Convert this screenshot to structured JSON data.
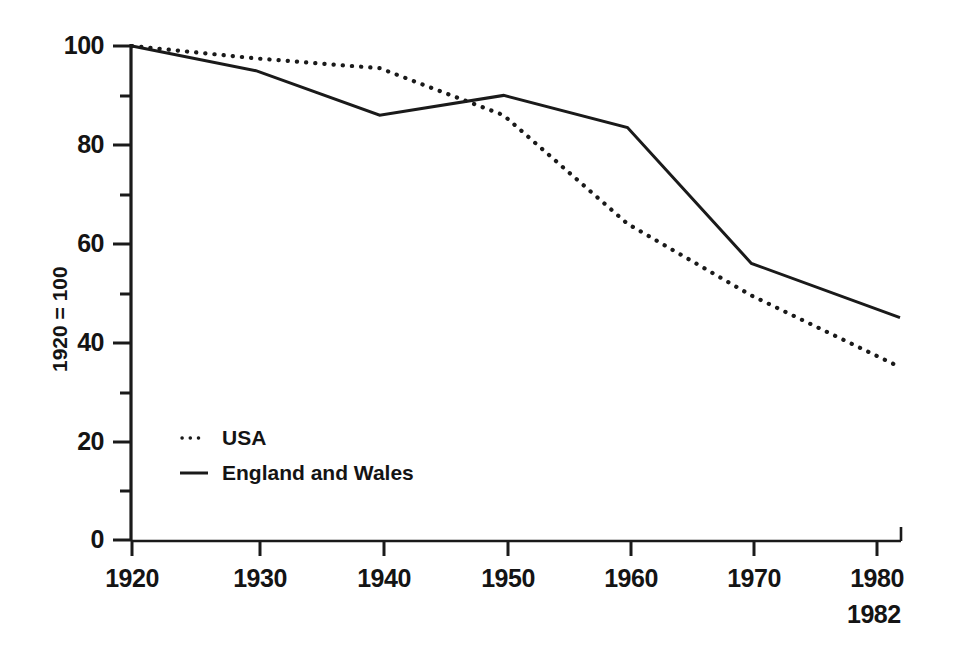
{
  "chart_data": {
    "type": "line",
    "title": "",
    "subtitle": "",
    "xlabel": "",
    "ylabel": "1920 = 100",
    "xlim": [
      1920,
      1982
    ],
    "ylim": [
      0,
      100
    ],
    "x_ticks": [
      1920,
      1930,
      1940,
      1950,
      1960,
      1970,
      1980
    ],
    "x_tick_labels": [
      "1920",
      "1930",
      "1940",
      "1950",
      "1960",
      "1970",
      "1980"
    ],
    "x_axis_end_label": "1982",
    "y_ticks": [
      0,
      20,
      40,
      60,
      80,
      100
    ],
    "y_tick_labels": [
      "0",
      "20",
      "40",
      "60",
      "80",
      "100"
    ],
    "y_minor_ticks": [
      10,
      30,
      50,
      70,
      90
    ],
    "grid": false,
    "legend_position": "inner-lower-left",
    "series": [
      {
        "name": "USA",
        "style": "dotted",
        "color": "#1a1a1a",
        "x": [
          1920,
          1930,
          1940,
          1950,
          1960,
          1970,
          1982
        ],
        "values": [
          100,
          97.5,
          95.5,
          86,
          64,
          49.5,
          35
        ]
      },
      {
        "name": "England and Wales",
        "style": "solid",
        "color": "#1a1a1a",
        "x": [
          1920,
          1930,
          1940,
          1950,
          1960,
          1970,
          1982
        ],
        "values": [
          100,
          95,
          86,
          90,
          83.5,
          56,
          45
        ]
      }
    ]
  },
  "legend": {
    "items": [
      {
        "label": "USA",
        "style": "dotted"
      },
      {
        "label": "England and Wales",
        "style": "solid"
      }
    ]
  },
  "axis": {
    "y_title": "1920 = 100",
    "end_year": "1982"
  }
}
